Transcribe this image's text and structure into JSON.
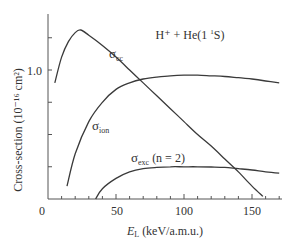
{
  "chart_data": {
    "type": "line",
    "title_parts": {
      "main": "H⁺ + He(1 ",
      "sup": "1",
      "tail": "S)"
    },
    "xlabel": "E_L (keV/a.m.u.)",
    "xlabel_parts": {
      "var": "E",
      "sub": "L",
      "unit": " (keV/a.m.u.)"
    },
    "ylabel": "Cross-section (10⁻¹⁶ cm²)",
    "xlim": [
      0,
      170
    ],
    "ylim": [
      0,
      1.4
    ],
    "x_tick_labels": [
      "0",
      "50",
      "100",
      "150"
    ],
    "x_ticks": [
      0,
      50,
      100,
      150
    ],
    "x_minor_step": 10,
    "y_tick_labels": [
      "1.0"
    ],
    "y_ticks_labeled": [
      1.0
    ],
    "grid": false,
    "legend": "inline labels on curves",
    "series": [
      {
        "name": "σ_cc",
        "label_main": "σ",
        "label_sub": "cc",
        "x": [
          5,
          10,
          15,
          20,
          24,
          30,
          40,
          50,
          60,
          70,
          80,
          90,
          100,
          110,
          120,
          130,
          140,
          150,
          158
        ],
        "y": [
          0.9,
          1.1,
          1.22,
          1.29,
          1.31,
          1.27,
          1.19,
          1.1,
          1.0,
          0.9,
          0.8,
          0.7,
          0.6,
          0.5,
          0.41,
          0.31,
          0.21,
          0.1,
          0.02
        ]
      },
      {
        "name": "σ_ion",
        "label_main": "σ",
        "label_sub": "ion",
        "x": [
          14,
          20,
          30,
          40,
          50,
          60,
          70,
          80,
          90,
          100,
          110,
          120,
          130,
          140,
          150,
          160,
          170
        ],
        "y": [
          0.1,
          0.35,
          0.6,
          0.75,
          0.85,
          0.9,
          0.93,
          0.945,
          0.955,
          0.96,
          0.96,
          0.955,
          0.95,
          0.94,
          0.93,
          0.915,
          0.9
        ]
      },
      {
        "name": "σ_exc (n = 2)",
        "label_main": "σ",
        "label_sub": "exc",
        "label_tail": " (n = 2)",
        "x": [
          35,
          40,
          50,
          60,
          70,
          80,
          90,
          100,
          110,
          120,
          130,
          140,
          150,
          160,
          170
        ],
        "y": [
          0.0,
          0.08,
          0.16,
          0.21,
          0.235,
          0.245,
          0.25,
          0.25,
          0.25,
          0.248,
          0.245,
          0.235,
          0.225,
          0.21,
          0.2
        ]
      }
    ]
  }
}
